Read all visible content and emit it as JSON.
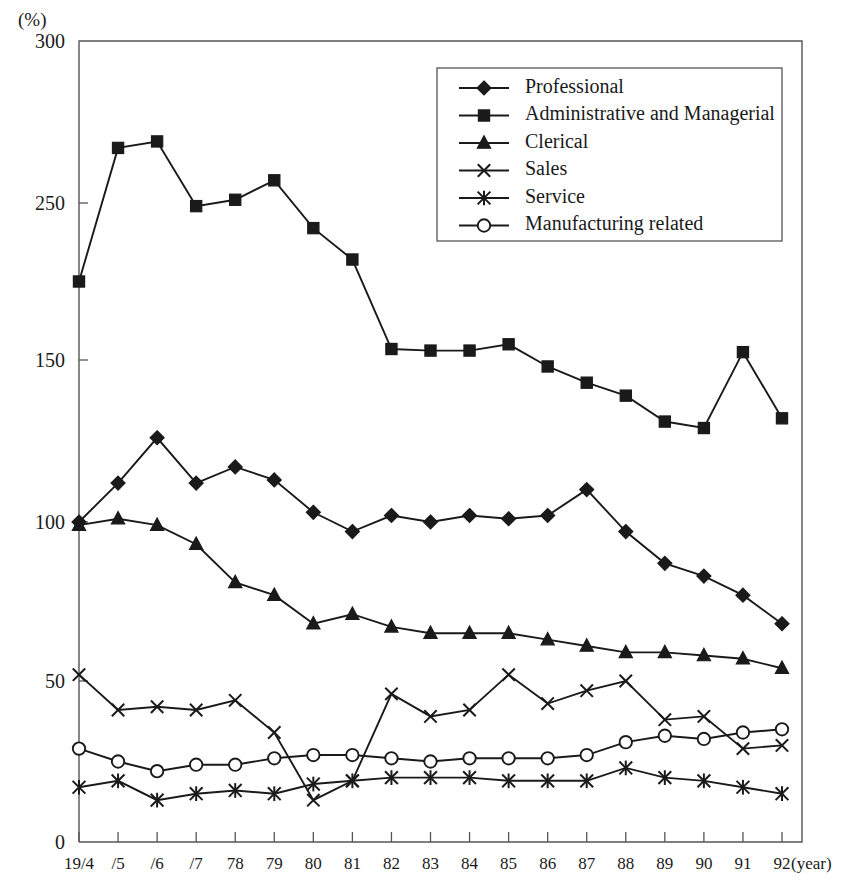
{
  "chart_data": {
    "type": "line",
    "title": "",
    "subtitle": "",
    "xlabel": "year",
    "ylabel": "",
    "unit_label": "(%)",
    "year_suffix_label": "(year)",
    "grid": false,
    "legend_position": "top-right",
    "xlim": [
      1974,
      1992
    ],
    "ylim": [
      0,
      300
    ],
    "yticks": [
      0,
      50,
      100,
      150,
      250,
      300
    ],
    "ytick_labels": [
      "0",
      "50",
      "100",
      "150",
      "250",
      "300"
    ],
    "x": [
      1974,
      1975,
      1976,
      1977,
      1978,
      1979,
      1980,
      1981,
      1982,
      1983,
      1984,
      1985,
      1986,
      1987,
      1988,
      1989,
      1990,
      1991,
      1992
    ],
    "xtick_labels": [
      "19/4",
      "/5",
      "/6",
      "/7",
      "78",
      "79",
      "80",
      "81",
      "82",
      "83",
      "84",
      "85",
      "86",
      "87",
      "88",
      "89",
      "90",
      "91",
      "92"
    ],
    "series": [
      {
        "name": "Professional",
        "marker": "diamond",
        "values": [
          100,
          112,
          126,
          112,
          117,
          113,
          103,
          97,
          102,
          100,
          102,
          101,
          102,
          110,
          97,
          87,
          83,
          77,
          68
        ]
      },
      {
        "name": "Administrative and Managerial",
        "marker": "square",
        "values": [
          200,
          267,
          269,
          248,
          251,
          257,
          234,
          214,
          157,
          156,
          156,
          160,
          148,
          143,
          139,
          131,
          129,
          155,
          132
        ]
      },
      {
        "name": "Clerical",
        "marker": "triangle",
        "values": [
          99,
          101,
          99,
          93,
          81,
          77,
          68,
          71,
          67,
          65,
          65,
          65,
          63,
          61,
          59,
          59,
          58,
          57,
          54
        ]
      },
      {
        "name": "Sales",
        "marker": "x",
        "values": [
          52,
          41,
          42,
          41,
          44,
          34,
          13,
          19,
          46,
          39,
          41,
          52,
          43,
          47,
          50,
          38,
          39,
          29,
          30
        ]
      },
      {
        "name": "Service",
        "marker": "asterisk",
        "values": [
          17,
          19,
          13,
          15,
          16,
          15,
          18,
          19,
          20,
          20,
          20,
          19,
          19,
          19,
          23,
          20,
          19,
          17,
          15
        ]
      },
      {
        "name": "Manufacturing related",
        "marker": "circle",
        "values": [
          29,
          25,
          22,
          24,
          24,
          26,
          27,
          27,
          26,
          25,
          26,
          26,
          26,
          27,
          31,
          33,
          32,
          34,
          35
        ]
      }
    ]
  },
  "legend": {
    "entries": [
      {
        "label": "Professional"
      },
      {
        "label": "Administrative and Managerial"
      },
      {
        "label": "Clerical"
      },
      {
        "label": "Sales"
      },
      {
        "label": "Service"
      },
      {
        "label": "Manufacturing related"
      }
    ]
  },
  "colors": {
    "ink": "#1a1a1a",
    "frame": "#555555",
    "background": "#ffffff"
  }
}
